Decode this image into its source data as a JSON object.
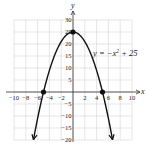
{
  "chart_data": {
    "type": "line",
    "title": "",
    "xlabel": "x",
    "ylabel": "y",
    "equation_label": "y = −x² + 25",
    "function": "-x^2 + 25",
    "xlim": [
      -10,
      10
    ],
    "ylim": [
      -20,
      30
    ],
    "x_ticks": [
      -10,
      -8,
      -6,
      -4,
      -2,
      2,
      4,
      6,
      8,
      10
    ],
    "y_ticks": [
      -20,
      -15,
      -10,
      -5,
      5,
      10,
      15,
      20,
      25,
      30
    ],
    "grid": true,
    "series": [
      {
        "name": "y = -x^2 + 25",
        "x": [
          -6.7,
          -6,
          -5,
          -4,
          -3,
          -2,
          -1,
          0,
          1,
          2,
          3,
          4,
          5,
          6,
          6.7
        ],
        "y": [
          -19.89,
          -11,
          0,
          9,
          16,
          21,
          24,
          25,
          24,
          21,
          16,
          9,
          0,
          -11,
          -19.89
        ],
        "arrows_at_ends": true
      }
    ],
    "highlighted_points": [
      {
        "label": "x-intercept",
        "x": -5,
        "y": 0
      },
      {
        "label": "vertex / y-intercept",
        "x": 0,
        "y": 25
      },
      {
        "label": "x-intercept",
        "x": 5,
        "y": 0
      }
    ]
  },
  "colors": {
    "curve": "#111111",
    "grid": "#d4d4d4",
    "axis": "#333333",
    "background": "#ffffff"
  }
}
